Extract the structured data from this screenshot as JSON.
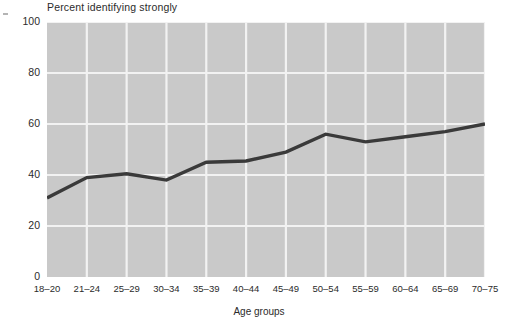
{
  "chart_data": {
    "type": "line",
    "title": "",
    "ylabel": "Percent identifying strongly",
    "xlabel": "Age groups",
    "categories": [
      "18–20",
      "21–24",
      "25–29",
      "30–34",
      "35–39",
      "40–44",
      "45–49",
      "50–54",
      "55–59",
      "60–64",
      "65–69",
      "70–75"
    ],
    "values": [
      31,
      39,
      40.5,
      38,
      45,
      45.5,
      49,
      56,
      53,
      55,
      57,
      60
    ],
    "ylim": [
      0,
      100
    ],
    "y_ticks": [
      "0",
      "20",
      "40",
      "60",
      "80",
      "100"
    ],
    "y_tick_values": [
      0,
      20,
      40,
      60,
      80,
      100
    ],
    "grid": true,
    "legend": "none",
    "series": [
      {
        "name": "Percent identifying strongly",
        "values": [
          31,
          39,
          40.5,
          38,
          45,
          45.5,
          49,
          56,
          53,
          55,
          57,
          60
        ]
      }
    ],
    "colors": {
      "plot_background": "#c9c9c9",
      "gridline": "#f2f2f2",
      "line": "#3a3a3a",
      "text": "#2b2b2b",
      "page_background": "#ffffff"
    }
  }
}
